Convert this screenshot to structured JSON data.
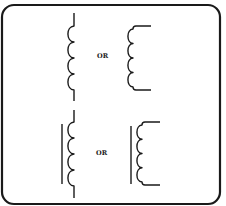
{
  "diagram": {
    "colors": {
      "ink": "#1a1a1a",
      "background": "#ffffff"
    },
    "frame": {
      "x": 2,
      "y": 5,
      "width": 218,
      "height": 199,
      "radius": 12
    },
    "rows": [
      {
        "id": "air-core",
        "separator_label": "OR",
        "label_pos": {
          "x": 97,
          "y": 57.5
        },
        "symbols": [
          {
            "id": "air-core-vertical-leads",
            "type": "inductor",
            "core": false,
            "leads": "vertical",
            "coil_x": 74,
            "top_lead_y": 13,
            "coil_top_y": 26,
            "coil_bottom_y": 90,
            "bottom_lead_y": 101,
            "turns": 4,
            "bulge": 6
          },
          {
            "id": "air-core-horizontal-leads",
            "type": "inductor",
            "core": false,
            "leads": "horizontal",
            "coil_x": 133,
            "coil_top_y": 26,
            "coil_bottom_y": 90,
            "lead_end_x": 151,
            "turns": 4,
            "bulge": 5
          }
        ]
      },
      {
        "id": "iron-core",
        "separator_label": "OR",
        "label_pos": {
          "x": 96,
          "y": 154.5
        },
        "symbols": [
          {
            "id": "iron-core-vertical-leads",
            "type": "inductor",
            "core": true,
            "core_x": 62,
            "core_top_y": 124,
            "core_bottom_y": 184,
            "leads": "vertical",
            "coil_x": 74,
            "top_lead_y": 110,
            "coil_top_y": 122,
            "coil_bottom_y": 186,
            "bottom_lead_y": 198,
            "turns": 4,
            "bulge": 6
          },
          {
            "id": "iron-core-horizontal-leads",
            "type": "inductor",
            "core": true,
            "core_x": 131,
            "core_top_y": 126,
            "core_bottom_y": 184,
            "leads": "horizontal",
            "coil_x": 142,
            "coil_top_y": 122,
            "coil_bottom_y": 185,
            "lead_end_x": 160,
            "turns": 4,
            "bulge": 5
          }
        ]
      }
    ]
  }
}
